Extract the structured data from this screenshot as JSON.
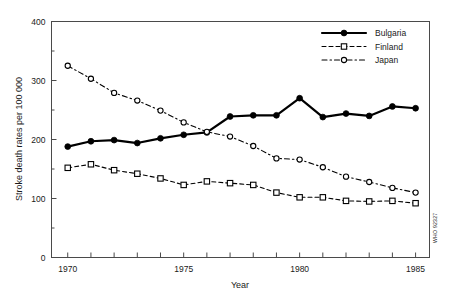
{
  "chart_data": {
    "type": "line",
    "title": "",
    "xlabel": "Year",
    "ylabel": "Stroke death rates per 100 000",
    "xlim": [
      1969.3,
      1985.6
    ],
    "ylim": [
      0,
      400
    ],
    "ytick_values": [
      0,
      100,
      200,
      300,
      400
    ],
    "ytick_labels": [
      "0",
      "100",
      "200",
      "300",
      "400"
    ],
    "xtick_values": [
      1970,
      1971,
      1972,
      1973,
      1974,
      1975,
      1976,
      1977,
      1978,
      1979,
      1980,
      1981,
      1982,
      1983,
      1984,
      1985
    ],
    "xtick_labels_shown": [
      "1970",
      "1975",
      "1980",
      "1985"
    ],
    "xtick_labeled_values": [
      1970,
      1975,
      1980,
      1985
    ],
    "grid": false,
    "legend_position": "top-right",
    "x": [
      1970,
      1971,
      1972,
      1973,
      1974,
      1975,
      1976,
      1977,
      1978,
      1979,
      1980,
      1981,
      1982,
      1983,
      1984,
      1985
    ],
    "series": [
      {
        "name": "Bulgaria",
        "marker": "filled-circle",
        "linestyle": "solid",
        "color": "#000000",
        "values": [
          188,
          197,
          199,
          194,
          202,
          208,
          212,
          239,
          241,
          241,
          270,
          238,
          244,
          240,
          256,
          253
        ]
      },
      {
        "name": "Finland",
        "marker": "open-square",
        "linestyle": "dashed",
        "color": "#000000",
        "values": [
          152,
          158,
          148,
          142,
          134,
          123,
          129,
          126,
          123,
          110,
          102,
          102,
          96,
          95,
          96,
          92
        ]
      },
      {
        "name": "Japan",
        "marker": "open-circle",
        "linestyle": "dash-dot",
        "color": "#000000",
        "values": [
          325,
          303,
          279,
          266,
          249,
          229,
          213,
          205,
          189,
          168,
          166,
          153,
          137,
          128,
          118,
          110
        ]
      }
    ]
  },
  "figure": {
    "credit": "WHO 92327"
  }
}
